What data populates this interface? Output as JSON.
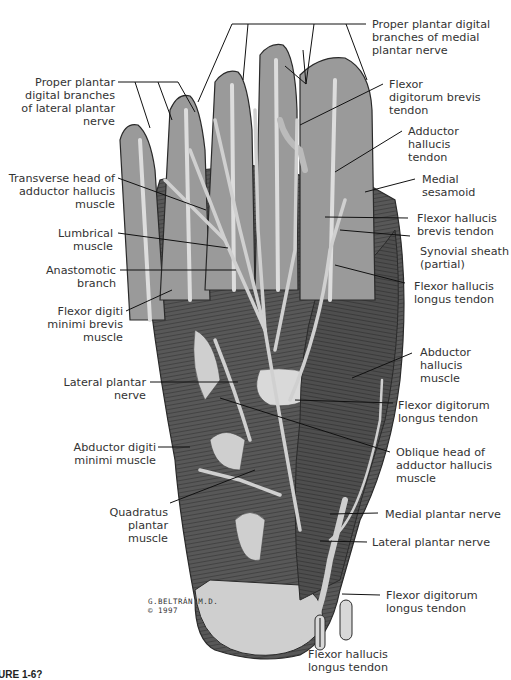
{
  "figure": {
    "label_partial": "URE 1-6?",
    "signature": "G.BELTRÁN M.D.",
    "copyright": "© 1997"
  },
  "labels_left": [
    {
      "id": "proper-plantar-lateral",
      "text": "Proper plantar\ndigital branches\nof lateral plantar\nnerve"
    },
    {
      "id": "transverse-head-adductor",
      "text": "Transverse head of\nadductor hallucis\nmuscle"
    },
    {
      "id": "lumbrical",
      "text": "Lumbrical\nmuscle"
    },
    {
      "id": "anastomotic-branch",
      "text": "Anastomotic\nbranch"
    },
    {
      "id": "flexor-digiti-minimi-brevis",
      "text": "Flexor digiti\nminimi brevis\nmuscle"
    },
    {
      "id": "lateral-plantar-nerve-upper",
      "text": "Lateral plantar\nnerve"
    },
    {
      "id": "abductor-digiti-minimi",
      "text": "Abductor digiti\nminimi muscle"
    },
    {
      "id": "quadratus-plantar",
      "text": "Quadratus\nplantar\nmuscle"
    }
  ],
  "labels_right": [
    {
      "id": "proper-plantar-medial",
      "text": "Proper plantar digital\nbranches of medial\nplantar nerve"
    },
    {
      "id": "fdb-tendon",
      "text": "Flexor\ndigitorum brevis\ntendon"
    },
    {
      "id": "adductor-hallucis-tendon",
      "text": "Adductor\nhallucis\ntendon"
    },
    {
      "id": "medial-sesamoid",
      "text": "Medial\nsesamoid"
    },
    {
      "id": "fhb-tendon",
      "text": "Flexor hallucis\nbrevis tendon"
    },
    {
      "id": "synovial-sheath",
      "text": "Synovial sheath\n(partial)"
    },
    {
      "id": "fhl-tendon-upper",
      "text": "Flexor hallucis\nlongus tendon"
    },
    {
      "id": "abductor-hallucis",
      "text": "Abductor\nhallucis\nmuscle"
    },
    {
      "id": "fdl-tendon-upper",
      "text": "Flexor digitorum\nlongus tendon"
    },
    {
      "id": "oblique-head-adductor",
      "text": "Oblique head of\nadductor hallucis\nmuscle"
    },
    {
      "id": "medial-plantar-nerve",
      "text": "Medial plantar nerve"
    },
    {
      "id": "lateral-plantar-nerve-lower",
      "text": "Lateral plantar nerve"
    },
    {
      "id": "fdl-tendon-lower",
      "text": "Flexor digitorum\nlongus tendon"
    }
  ],
  "labels_bottom": [
    {
      "id": "fhl-tendon-lower",
      "text": "Flexor hallucis\nlongus tendon"
    }
  ],
  "colors": {
    "muscle": "#5a5a5a",
    "muscle_dark": "#3e3e3e",
    "tendon": "#d8d8d8",
    "nerve": "#c9c9c9",
    "outline": "#2a2a2a",
    "leader": "#111111",
    "text": "#333333"
  }
}
